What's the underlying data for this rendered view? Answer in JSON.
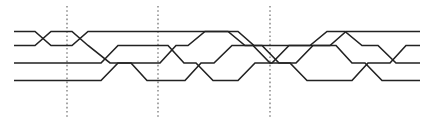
{
  "figure": {
    "width": 431,
    "height": 124,
    "background_color": "#ffffff",
    "strand_color": "#222222",
    "divider_color": "#6b6b6b",
    "strand_width": 1.6,
    "strand_count": 4,
    "crossing_style": "plain-X (no over/under break)"
  },
  "levels": {
    "label": "horizontal strand track y-positions",
    "y": [
      31.5,
      45.5,
      63.0,
      80.5
    ],
    "names": [
      "track-1",
      "track-2",
      "track-3",
      "track-4"
    ]
  },
  "dividers": {
    "label": "vertical dotted section separators",
    "count": 3,
    "x": [
      67,
      158,
      270
    ],
    "y_top": 6,
    "y_bottom": 118,
    "dash": "1.6 2.6"
  },
  "chart_data": {
    "type": "line",
    "xlabel": "",
    "ylabel": "",
    "xlim": [
      0,
      431
    ],
    "ylim": [
      0,
      124
    ],
    "grid": false,
    "legend_position": "none",
    "series": [
      {
        "name": "strand-1",
        "points": "14,31.5 35,31.5 51,45.5 72,45.5 88,31.5 238,31.5 254,45.5 330,45.5 346,31.5 420,31.5"
      },
      {
        "name": "strand-2",
        "points": "14,45.5 35,45.5 51,31.5 72,31.5 88,45.5 110,63.0 131,63.0 147,80.5 185,80.5 201,63.0 214,63.0 232,45.5 253,45.5 270,63.0 290,63.0 307,80.5 352,80.5 368,63.0 390,63.0 406,45.5 420,45.5"
      },
      {
        "name": "strand-3",
        "points": "14,63.0 101,63.0 118,45.5 168,45.5 184,63.0 196,63.0 213,80.5 238,80.5 255,63.0 272,63.0 289,45.5 310,45.5 327,31.5 345,31.5 362,45.5 378,45.5 396,63.0 420,63.0"
      },
      {
        "name": "strand-4",
        "points": "14,80.5 101,80.5 118,63.0 160,63.0 176,45.5 188,45.5 205,31.5 228,31.5 245,45.5 262,45.5 279,63.0 296,63.0 313,45.5 336,45.5 352,63.0 365,63.0 382,80.5 420,80.5"
      }
    ]
  }
}
